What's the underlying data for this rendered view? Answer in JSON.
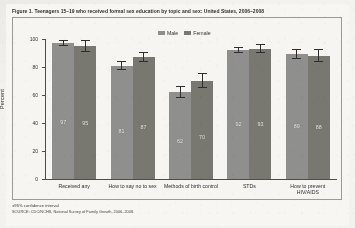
{
  "figure": {
    "title": "Figure 1. Teenagers 15–19 who received formal sex education by topic and sex: United States, 2006–2008",
    "footnote": "±95% confidence interval",
    "source": "SOURCE: CDC/NCHS, National Survey of Family Growth, 2006–2008."
  },
  "legend": {
    "male_label": "Male",
    "female_label": "Female",
    "male_color": "#8e8e8c",
    "female_color": "#76766f",
    "position": "top-center"
  },
  "axis": {
    "ylabel": "Percent",
    "yticks": [
      "0",
      "20",
      "40",
      "60",
      "80",
      "100"
    ]
  },
  "chart_data": {
    "type": "bar",
    "title": "Figure 1. Teenagers 15–19 who received formal sex education by topic and sex: United States, 2006–2008",
    "xlabel": "",
    "ylabel": "Percent",
    "ylim": [
      0,
      100
    ],
    "yticks": [
      0,
      20,
      40,
      60,
      80,
      100
    ],
    "grid": false,
    "legend": [
      "Male",
      "Female"
    ],
    "legend_position": "top-center",
    "categories": [
      "Received any",
      "How to say no to sex",
      "Methods of birth control",
      "STDs",
      "How to prevent HIV/AIDS"
    ],
    "series": [
      {
        "name": "Male",
        "color": "#8e8e8c",
        "values": [
          97,
          81,
          62,
          92,
          89
        ],
        "errors": [
          2,
          3,
          4,
          2,
          3
        ]
      },
      {
        "name": "Female",
        "color": "#76766f",
        "values": [
          95,
          87,
          70,
          93,
          88
        ],
        "errors": [
          4,
          3,
          5,
          3,
          4
        ]
      }
    ],
    "value_labels": [
      {
        "category": "Received any",
        "male": "97",
        "female": "95"
      },
      {
        "category": "How to say no to sex",
        "male": "81",
        "female": "87"
      },
      {
        "category": "Methods of birth control",
        "male": "62",
        "female": "70"
      },
      {
        "category": "STDs",
        "male": "92",
        "female": "93"
      },
      {
        "category": "How to prevent HIV/AIDS",
        "male": "89",
        "female": "88"
      }
    ],
    "annotations": [
      "±95% confidence interval"
    ]
  }
}
